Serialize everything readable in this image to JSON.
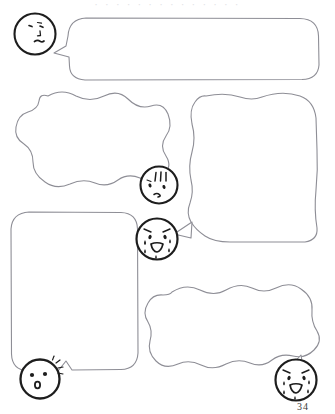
{
  "page": {
    "title": "Comic Speech Bubble Worksheet",
    "page_number": "34",
    "width": 335,
    "height": 414,
    "background_color": "#ffffff",
    "ink_color": "#3a3a3a",
    "faint_ink_color": "#8e8e96",
    "header_partial_text": "· · · · · · · · · · · · · ·",
    "header_note": "cropped line of text at top edge (illegible)"
  },
  "bubbles": [
    {
      "id": "bubble-1",
      "label": "Empty speech bubble 1 (top, wide rounded rectangle)",
      "shape": "rounded-rectangle",
      "tail_direction": "left",
      "content": "",
      "x": 68,
      "y": 18,
      "width": 251,
      "height": 62
    },
    {
      "id": "bubble-2",
      "label": "Empty speech bubble 2 (middle left, cloud / wavy)",
      "shape": "cloud",
      "tail_direction": "right",
      "content": "",
      "x": 10,
      "y": 92,
      "width": 166,
      "height": 97
    },
    {
      "id": "bubble-3",
      "label": "Empty speech bubble 3 (middle right, wavy rectangle)",
      "shape": "wavy-rectangle",
      "tail_direction": "left",
      "content": "",
      "x": 189,
      "y": 94,
      "width": 136,
      "height": 148
    },
    {
      "id": "bubble-4",
      "label": "Empty speech bubble 4 (lower left, rounded rectangle)",
      "shape": "rounded-rectangle",
      "tail_direction": "bottom-left",
      "content": "",
      "x": 11,
      "y": 211,
      "width": 127,
      "height": 160
    },
    {
      "id": "bubble-5",
      "label": "Empty speech bubble 5 (bottom right, cloud / wavy)",
      "shape": "cloud",
      "tail_direction": "right",
      "content": "",
      "x": 146,
      "y": 284,
      "width": 175,
      "height": 110
    }
  ],
  "faces": [
    {
      "id": "face-1",
      "label": "Round character head, worried expression",
      "expression": "worried",
      "features": [
        "two slanted dot eyes",
        "small nose tick",
        "small wavy mouth"
      ],
      "attached_bubble": "bubble-1",
      "cx": 35,
      "cy": 34,
      "r": 21
    },
    {
      "id": "face-2",
      "label": "Round character head, flustered expression with emphasis lines",
      "expression": "flustered",
      "features": [
        "three vertical hatch marks on forehead",
        "two dot eyes",
        "small puckered mouth"
      ],
      "attached_bubble": "bubble-2",
      "cx": 159,
      "cy": 185,
      "r": 19
    },
    {
      "id": "face-3",
      "label": "Round character head, crying expression",
      "expression": "crying",
      "features": [
        "slanted sad eyebrows",
        "two dot eyes",
        "teardrops",
        "open downturned mouth"
      ],
      "attached_bubble": "bubble-3",
      "cx": 157,
      "cy": 239,
      "r": 21
    },
    {
      "id": "face-4",
      "label": "Round character head, surprised expression",
      "expression": "surprised",
      "features": [
        "two round dot eyes",
        "small open round mouth",
        "emphasis sparks at upper right"
      ],
      "attached_bubble": "bubble-4",
      "cx": 40,
      "cy": 379,
      "r": 20
    },
    {
      "id": "face-5",
      "label": "Round character head, crying expression",
      "expression": "crying",
      "features": [
        "slanted sad eyebrows",
        "two dot eyes",
        "teardrops",
        "open downturned mouth"
      ],
      "attached_bubble": "bubble-5",
      "cx": 296,
      "cy": 380,
      "r": 21
    }
  ]
}
